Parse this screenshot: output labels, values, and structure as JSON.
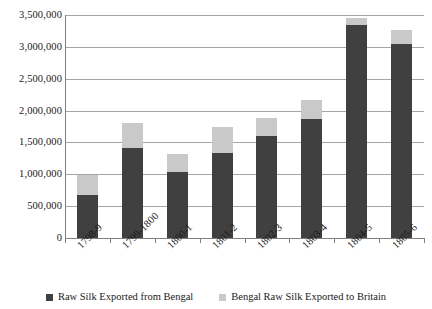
{
  "chart_data": {
    "type": "bar",
    "subtype": "stacked-bar",
    "title": "",
    "xlabel": "",
    "ylabel": "",
    "ylim": [
      0,
      3500000
    ],
    "ytick_labels": [
      "3,500,000",
      "3,000,000",
      "2,500,000",
      "2,000,000",
      "1,500,000",
      "1,000,000",
      "500,000",
      "0"
    ],
    "ytick_values": [
      3500000,
      3000000,
      2500000,
      2000000,
      1500000,
      1000000,
      500000,
      0
    ],
    "grid": true,
    "legend_position": "bottom",
    "categories": [
      "1798-9",
      "1799-1800",
      "1800-1",
      "1801-2",
      "1802-3",
      "1803-4",
      "1804-5",
      "1805-6"
    ],
    "series": [
      {
        "name": "Raw Silk Exported from Bengal",
        "color": "#404040",
        "values": [
          670000,
          1420000,
          1030000,
          1340000,
          1600000,
          1870000,
          3340000,
          3040000
        ]
      },
      {
        "name": "Bengal Raw Silk Exported to Britain",
        "color": "#c9c9c9",
        "values": [
          320000,
          390000,
          290000,
          400000,
          280000,
          300000,
          110000,
          220000
        ]
      }
    ],
    "totals": [
      990000,
      1810000,
      1320000,
      1740000,
      1880000,
      2170000,
      3450000,
      3260000
    ]
  },
  "legend": {
    "items": [
      {
        "label": "Raw Silk Exported from Bengal",
        "swatch": "dark-square-swatch"
      },
      {
        "label": "Bengal Raw Silk Exported to Britain",
        "swatch": "light-square-swatch"
      }
    ]
  },
  "colors": {
    "series_dark": "#404040",
    "series_light": "#c9c9c9",
    "gridline": "#a6a6a6",
    "axis": "#808080",
    "background": "#ffffff",
    "text": "#1a1a1a"
  }
}
